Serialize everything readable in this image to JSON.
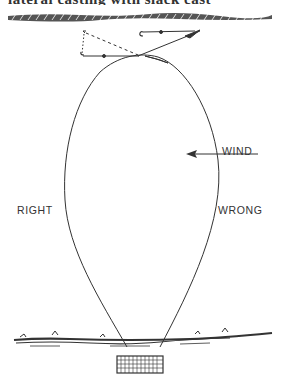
{
  "figure": {
    "clipped_caption": "lateral casting with slack cast",
    "labels": {
      "wind": "WIND",
      "right": "RIGHT",
      "wrong": "WRONG"
    },
    "elements": [
      "far-bank-rope-line",
      "fly-and-hook-positions",
      "dashed-drift-path",
      "teardrop-line-loop",
      "wind-arrow",
      "near-bank",
      "fishing-platform"
    ]
  }
}
